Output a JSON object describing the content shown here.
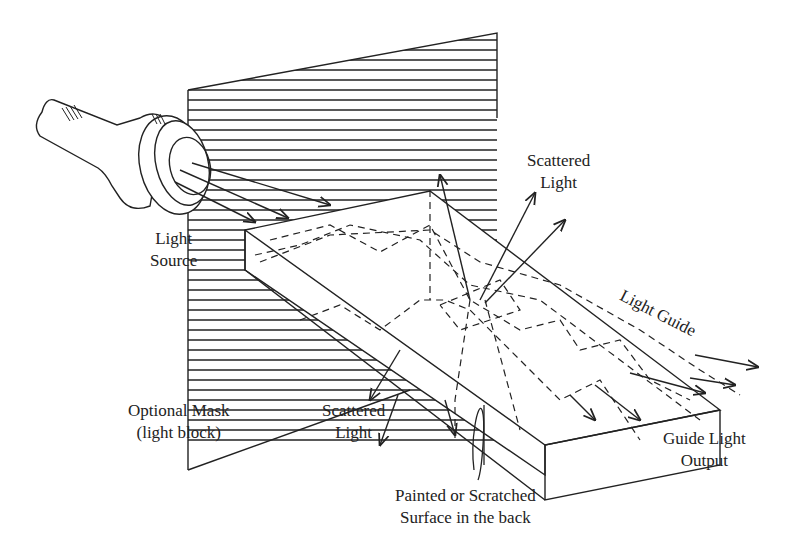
{
  "diagram": {
    "labels": {
      "light_source": [
        "Light",
        "Source"
      ],
      "scattered_light_top": [
        "Scattered",
        "Light"
      ],
      "light_guide": "Light Guide",
      "optional_mask": [
        "Optional Mask",
        "(light block)"
      ],
      "scattered_light_bottom": [
        "Scattered",
        "Light"
      ],
      "guide_light_output": [
        "Guide Light",
        "Output"
      ],
      "painted_surface": [
        "Painted or Scratched",
        "Surface in the back"
      ]
    },
    "components": [
      "flashlight",
      "hatched-mask-panel",
      "light-guide-slab",
      "scatter-spot"
    ],
    "line_color": "#222222",
    "background": "#ffffff"
  }
}
